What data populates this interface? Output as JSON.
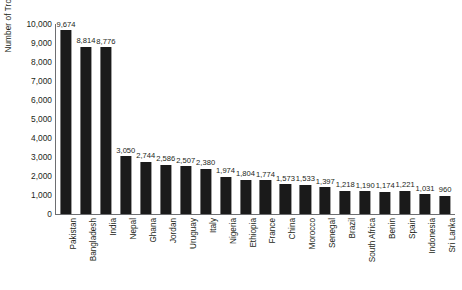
{
  "chart_data": {
    "type": "bar",
    "title": "",
    "xlabel": "",
    "ylabel": "Number of Troops",
    "ylim": [
      0,
      10000
    ],
    "ytick_labels": [
      "10,000",
      "9,000",
      "8,000",
      "7,000",
      "6,000",
      "5,000",
      "4,000",
      "3,000",
      "2,000",
      "1,000",
      "0"
    ],
    "ytick_values": [
      10000,
      9000,
      8000,
      7000,
      6000,
      5000,
      4000,
      3000,
      2000,
      1000,
      0
    ],
    "grid": false,
    "legend": false,
    "bar_color": "#1a1a1a",
    "axis_color": "#6d6e71",
    "background": "#ffffff",
    "data_labels_shown": true,
    "categories": [
      "Pakistan",
      "Bangladesh",
      "India",
      "Nepal",
      "Ghana",
      "Jordan",
      "Uruguay",
      "Italy",
      "Nigeria",
      "Ethiopia",
      "France",
      "China",
      "Morocco",
      "Senegal",
      "Brazil",
      "South Africa",
      "Benin",
      "Spain",
      "Indonesia",
      "Sri Lanka"
    ],
    "values": [
      9674,
      8814,
      8776,
      3050,
      2744,
      2586,
      2507,
      2380,
      1974,
      1804,
      1774,
      1573,
      1533,
      1397,
      1218,
      1190,
      1174,
      1221,
      1031,
      960
    ],
    "value_labels": [
      "9,674",
      "8,814",
      "8,776",
      "3,050",
      "2,744",
      "2,586",
      "2,507",
      "2,380",
      "1,974",
      "1,804",
      "1,774",
      "1,573",
      "1,533",
      "1,397",
      "1,218",
      "1,190",
      "1,174",
      "1,221",
      "1,031",
      "960"
    ]
  }
}
